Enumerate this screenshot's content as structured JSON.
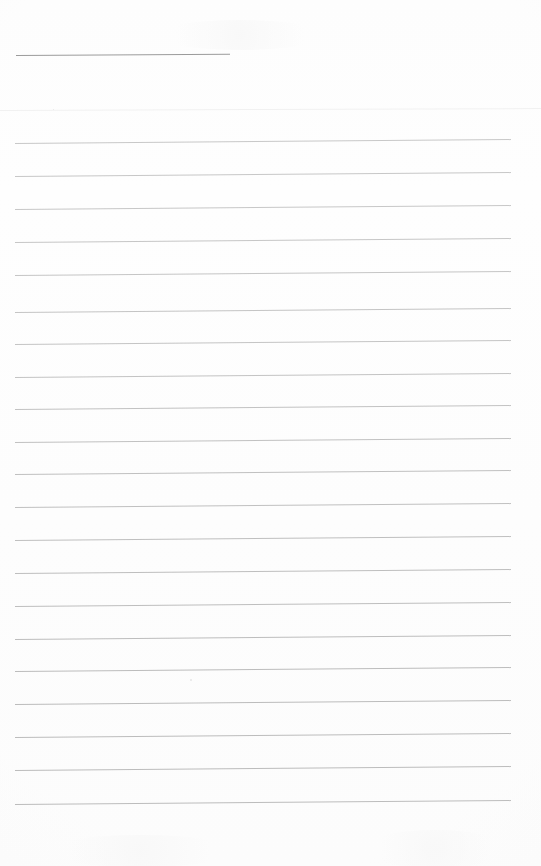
{
  "document": {
    "kind": "scanned-page",
    "title": "Blank ruled notepaper",
    "description": "A scanned blank sheet of ruled writing paper with a short heading rule near the top and a series of evenly spaced horizontal body rules. No handwriting or printed text is present.",
    "page_number": "",
    "text_content": "",
    "has_visible_text": "false"
  },
  "canvas": {
    "width": 541,
    "height": 866,
    "background_color": "#fdfdfd",
    "paper_tone": "#fefefe"
  },
  "palette": {
    "heading_rule_color": "#9b9b9b",
    "body_rule_color": "#bcbcbc",
    "faint_rule_color": "#f1f1f1",
    "page_background": "#fdfdfd",
    "speck_color": "#e6e6e6"
  },
  "rules": {
    "heading_rule": {
      "label": "heading-underline",
      "x": 16,
      "y": 55,
      "width": 214,
      "thickness": 1,
      "tilt_deg": -0.35,
      "color": "#9b9b9b"
    },
    "faint_divider": {
      "label": "faint-full-width-divider",
      "x": 0,
      "y": 110,
      "width": 541,
      "thickness": 1,
      "tilt_deg": -0.2,
      "color": "#f1f1f1"
    },
    "body_geometry": {
      "left_x": 15,
      "right_x": 511,
      "width": 496,
      "first_y": 143,
      "spacing": 33.05,
      "count": 21,
      "thickness": 1,
      "tilt_deg": -0.45,
      "color": "#bcbcbc"
    },
    "body_lines": [
      {
        "index": 1,
        "y": 143
      },
      {
        "index": 2,
        "y": 176
      },
      {
        "index": 3,
        "y": 209
      },
      {
        "index": 4,
        "y": 242
      },
      {
        "index": 5,
        "y": 275
      },
      {
        "index": 6,
        "y": 312
      },
      {
        "index": 7,
        "y": 344
      },
      {
        "index": 8,
        "y": 377
      },
      {
        "index": 9,
        "y": 409
      },
      {
        "index": 10,
        "y": 442
      },
      {
        "index": 11,
        "y": 474
      },
      {
        "index": 12,
        "y": 507
      },
      {
        "index": 13,
        "y": 540
      },
      {
        "index": 14,
        "y": 573
      },
      {
        "index": 15,
        "y": 606
      },
      {
        "index": 16,
        "y": 639
      },
      {
        "index": 17,
        "y": 671
      },
      {
        "index": 18,
        "y": 704
      },
      {
        "index": 19,
        "y": 737
      },
      {
        "index": 20,
        "y": 770
      },
      {
        "index": 21,
        "y": 804
      }
    ]
  },
  "artifacts": {
    "specks": [
      {
        "x": 190,
        "y": 679,
        "size": 2
      },
      {
        "x": 53,
        "y": 109,
        "size": 1
      }
    ],
    "blotches": [
      {
        "x": 360,
        "y": 830,
        "w": 150,
        "h": 38
      },
      {
        "x": 40,
        "y": 835,
        "w": 200,
        "h": 32
      },
      {
        "x": 150,
        "y": 20,
        "w": 180,
        "h": 30
      }
    ]
  },
  "margins": {
    "top_blank_height": 55,
    "bottom_blank_height": 62,
    "left_gutter": 15,
    "right_gutter": 30
  }
}
